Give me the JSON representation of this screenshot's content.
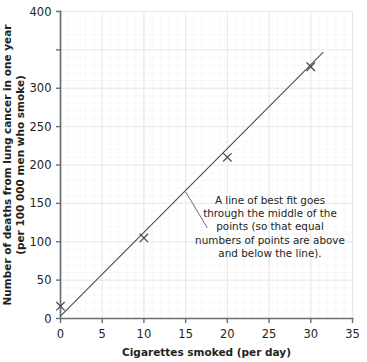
{
  "chart_data": {
    "type": "scatter",
    "title": "",
    "xlabel": "Cigarettes smoked (per day)",
    "ylabel_line1": "Number of deaths from lung cancer in one year",
    "ylabel_line2": "(per 100 000 men who smoke)",
    "xlim": [
      0,
      35
    ],
    "ylim": [
      0,
      400
    ],
    "xticks": [
      0,
      5,
      10,
      15,
      20,
      25,
      30,
      35
    ],
    "xtick_labels": [
      "0",
      "5",
      "10",
      "15",
      "20",
      "25",
      "30",
      "35"
    ],
    "yticks": [
      0,
      50,
      100,
      150,
      200,
      250,
      300,
      350,
      400
    ],
    "ytick_labels": [
      "0",
      "50",
      "100",
      "150",
      "200",
      "250",
      "300",
      "",
      "400"
    ],
    "grid": true,
    "grid_color": "#e8e8ec",
    "legend": "none",
    "marker": "x",
    "marker_color": "#4b4b4f",
    "points": [
      {
        "x": 0,
        "y": 16
      },
      {
        "x": 10,
        "y": 105
      },
      {
        "x": 20,
        "y": 210
      },
      {
        "x": 30,
        "y": 328
      }
    ],
    "trendline": {
      "name": "line of best fit",
      "x0": 0,
      "y0": 3,
      "x1": 31.5,
      "y1": 347,
      "color": "#4b4b4f"
    },
    "annotation": {
      "lines": [
        "A line of best fit goes",
        "through the middle of the",
        "points (so that equal",
        "numbers of points are above",
        "and below the line)."
      ],
      "pointer_from_x": 15.0,
      "pointer_from_y": 165,
      "pointer_to_x": 17.6,
      "pointer_to_y": 118
    }
  },
  "colors": {
    "axis": "#6d6e71",
    "text": "#231f20",
    "grid": "#e8e8ec",
    "data": "#4b4b4f"
  }
}
